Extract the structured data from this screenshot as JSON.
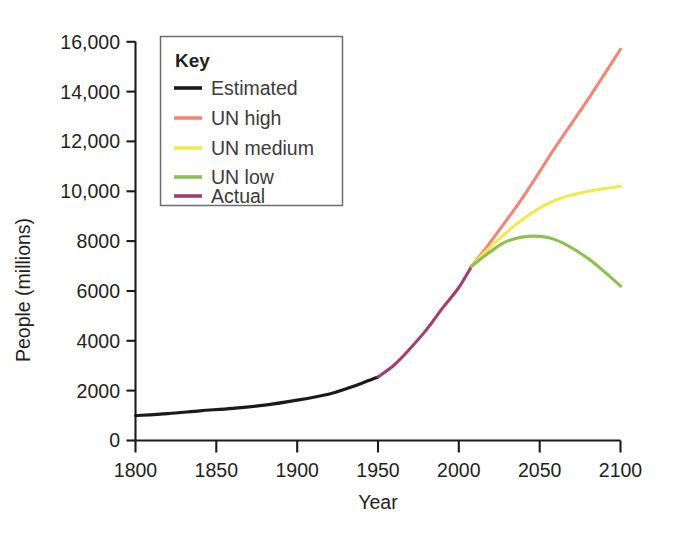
{
  "chart_data": {
    "type": "line",
    "title": "",
    "xlabel": "Year",
    "ylabel": "People (millions)",
    "xlim": [
      1800,
      2100
    ],
    "ylim": [
      0,
      16000
    ],
    "grid": false,
    "legend_position": "top-left-inside",
    "legend_title": "Key",
    "x_ticks": [
      "1800",
      "1850",
      "1900",
      "1950",
      "2000",
      "2050",
      "2100"
    ],
    "x_tick_values": [
      1800,
      1850,
      1900,
      1950,
      2000,
      2050,
      2100
    ],
    "y_ticks": [
      "0",
      "2000",
      "4000",
      "6000",
      "8000",
      "10,000",
      "12,000",
      "14,000",
      "16,000"
    ],
    "y_tick_values": [
      0,
      2000,
      4000,
      6000,
      8000,
      10000,
      12000,
      14000,
      16000
    ],
    "series": [
      {
        "name": "Estimated",
        "color": "#1a1a1a",
        "x": [
          1800,
          1820,
          1840,
          1860,
          1880,
          1900,
          1920,
          1930,
          1940,
          1950
        ],
        "values": [
          1000,
          1080,
          1190,
          1290,
          1420,
          1620,
          1870,
          2070,
          2300,
          2550
        ]
      },
      {
        "name": "Actual",
        "color": "#9e3f6e",
        "x": [
          1950,
          1960,
          1970,
          1980,
          1990,
          2000,
          2008
        ],
        "values": [
          2550,
          3030,
          3700,
          4450,
          5320,
          6140,
          7000
        ]
      },
      {
        "name": "UN high",
        "color": "#f08878",
        "x": [
          2008,
          2020,
          2040,
          2060,
          2080,
          2100
        ],
        "values": [
          7000,
          8000,
          9800,
          11800,
          13700,
          15700
        ]
      },
      {
        "name": "UN medium",
        "color": "#f5e84f",
        "x": [
          2008,
          2020,
          2040,
          2060,
          2080,
          2100
        ],
        "values": [
          7000,
          7800,
          8900,
          9650,
          10000,
          10200
        ]
      },
      {
        "name": "UN low",
        "color": "#8cc152",
        "x": [
          2008,
          2020,
          2030,
          2045,
          2060,
          2080,
          2100
        ],
        "values": [
          7000,
          7600,
          8000,
          8200,
          8050,
          7300,
          6200
        ]
      }
    ],
    "annotations": []
  },
  "legend": {
    "title": "Key",
    "entries": [
      {
        "label": "Estimated",
        "color": "#1a1a1a"
      },
      {
        "label": "UN high",
        "color": "#f08878"
      },
      {
        "label": "UN medium",
        "color": "#f5e84f"
      },
      {
        "label": "UN low",
        "color": "#8cc152"
      },
      {
        "label": "Actual",
        "color": "#9e3f6e"
      }
    ]
  },
  "axes": {
    "x_title": "Year",
    "y_title": "People (millions)"
  }
}
